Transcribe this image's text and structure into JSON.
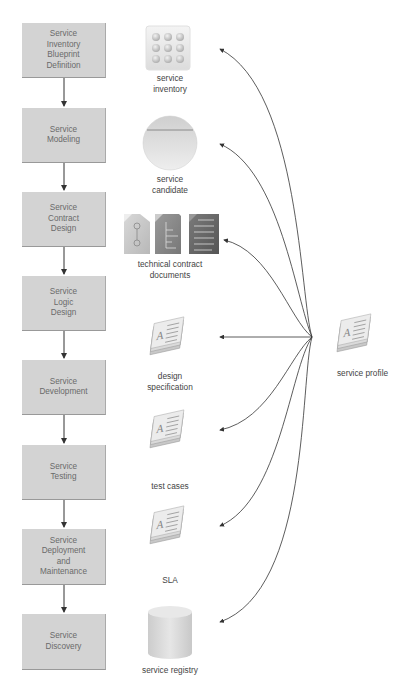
{
  "lifecycle_steps": [
    {
      "label": "Service\nInventory\nBlueprint\nDefinition",
      "top": 23,
      "height": 55
    },
    {
      "label": "Service\nModeling",
      "top": 108,
      "height": 55
    },
    {
      "label": "Service\nContract\nDesign",
      "top": 192,
      "height": 55
    },
    {
      "label": "Service\nLogic\nDesign",
      "top": 276,
      "height": 55
    },
    {
      "label": "Service\nDevelopment",
      "top": 360,
      "height": 55
    },
    {
      "label": "Service\nTesting",
      "top": 445,
      "height": 55
    },
    {
      "label": "Service\nDeployment\nand\nMaintenance",
      "top": 529,
      "height": 56
    },
    {
      "label": "Service\nDiscovery",
      "top": 614,
      "height": 56
    }
  ],
  "artifacts": [
    {
      "label": "service\ninventory",
      "icon": "grid-icon"
    },
    {
      "label": "service\ncandidate",
      "icon": "circle-icon"
    },
    {
      "label": "technical contract\ndocuments",
      "icon": "documents-icon"
    },
    {
      "label": "design\nspecification",
      "icon": "document-stack-icon"
    },
    {
      "label": "test cases",
      "icon": "document-stack-icon"
    },
    {
      "label": "SLA",
      "icon": "document-stack-icon"
    },
    {
      "label": "service registry",
      "icon": "database-icon"
    }
  ],
  "source": {
    "label": "service profile",
    "icon": "document-stack-icon"
  },
  "colors": {
    "box_fill": "#d3d3d3",
    "line": "#333333"
  }
}
